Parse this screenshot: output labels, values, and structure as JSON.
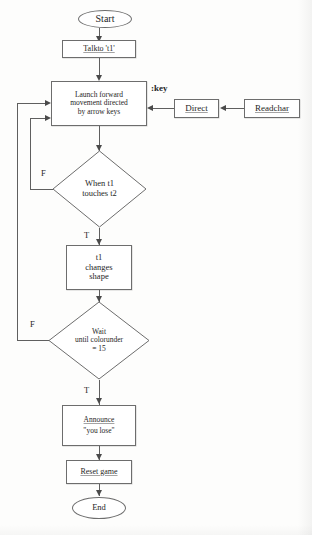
{
  "diagram": {
    "type": "flowchart",
    "colors": {
      "stroke": "#6d6d6d",
      "text": "#262626",
      "background": "#fdfdfc"
    },
    "nodes": {
      "start": {
        "label": "Start",
        "shape": "terminator"
      },
      "talk_to_t1": {
        "label": "Talkto 't1'",
        "shape": "process"
      },
      "launch_movement": {
        "line1": "Launch forward",
        "line2": "movement directed",
        "line3": "by arrow keys",
        "shape": "process"
      },
      "direct": {
        "label": "Direct",
        "shape": "process"
      },
      "readchar": {
        "label": "Readchar",
        "shape": "process"
      },
      "when_touches": {
        "line1": "When t1",
        "line2": "touches t2",
        "shape": "decision"
      },
      "t1_changes_shape": {
        "line1": "t1",
        "line2": "changes",
        "line3": "shape",
        "shape": "process"
      },
      "wait_colorunder": {
        "line1": "Wait",
        "line2": "until colorunder",
        "line3": "= 15",
        "shape": "decision"
      },
      "announce": {
        "line1": "Announce",
        "line2": "\"you lose\"",
        "shape": "process"
      },
      "reset_game": {
        "label": "Reset game",
        "shape": "process"
      },
      "end": {
        "label": "End",
        "shape": "terminator"
      }
    },
    "edge_labels": {
      "key": ":key",
      "touches_false": "F",
      "touches_true": "T",
      "colorunder_false": "F",
      "colorunder_true": "T"
    }
  }
}
